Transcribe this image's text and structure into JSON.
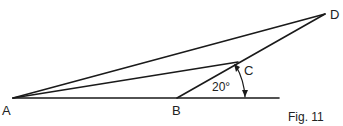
{
  "figure": {
    "caption": "Fig. 11",
    "points": {
      "A": "A",
      "B": "B",
      "C": "C",
      "D": "D"
    },
    "angle_label": "20°",
    "colors": {
      "line": "#1a1a1a",
      "background": "#ffffff"
    }
  }
}
